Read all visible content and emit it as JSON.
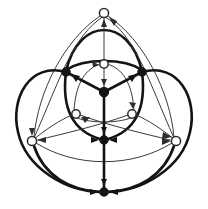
{
  "figure": {
    "width": 208,
    "height": 209,
    "background_color": "#ffffff",
    "symmetry": "3-fold rotational (C3)",
    "colors": {
      "thick_edge": "#141414",
      "thin_edge": "#3a3a3a",
      "filled_node": "#141414",
      "hollow_node_fill": "#ffffff",
      "hollow_node_stroke": "#2b2b2b"
    }
  },
  "legend": {
    "filled_node_label": "filled vertex",
    "hollow_node_label": "hollow vertex",
    "thick_edge_label": "thick directed edge",
    "thin_edge_label": "thin directed edge"
  },
  "nodes": [
    {
      "id": "n-outer-top",
      "name": "outer-top-node",
      "type": "hollow",
      "x": 104,
      "y": 13,
      "r": 4.6
    },
    {
      "id": "n-outer-left",
      "name": "outer-left-node",
      "type": "hollow",
      "x": 32,
      "y": 141,
      "r": 4.6
    },
    {
      "id": "n-outer-right",
      "name": "outer-right-node",
      "type": "hollow",
      "x": 176,
      "y": 141,
      "r": 4.6
    },
    {
      "id": "n-outer-bottom",
      "name": "outer-bottom-node",
      "type": "filled",
      "x": 104,
      "y": 192,
      "r": 4.2
    },
    {
      "id": "n-ring-left",
      "name": "ring-upper-left-node",
      "type": "filled",
      "x": 66,
      "y": 72,
      "r": 4.2
    },
    {
      "id": "n-ring-right",
      "name": "ring-upper-right-node",
      "type": "filled",
      "x": 142,
      "y": 72,
      "r": 4.2
    },
    {
      "id": "n-ring-bottom",
      "name": "ring-bottom-node",
      "type": "filled",
      "x": 104,
      "y": 140,
      "r": 4.2
    },
    {
      "id": "n-inner-top",
      "name": "inner-top-node",
      "type": "hollow",
      "x": 104,
      "y": 64,
      "r": 4.2
    },
    {
      "id": "n-inner-left",
      "name": "inner-lower-left-node",
      "type": "hollow",
      "x": 76,
      "y": 114,
      "r": 4.2
    },
    {
      "id": "n-inner-right",
      "name": "inner-lower-right-node",
      "type": "hollow",
      "x": 132,
      "y": 114,
      "r": 4.2
    },
    {
      "id": "n-hub",
      "name": "center-hub-node",
      "type": "filled",
      "x": 104,
      "y": 92,
      "r": 4.6
    }
  ],
  "edges": [
    {
      "name": "hub-to-ring-left",
      "from": "n-hub",
      "to": "n-ring-left",
      "weight": "thick",
      "directed": true
    },
    {
      "name": "hub-to-ring-right",
      "from": "n-hub",
      "to": "n-ring-right",
      "weight": "thick",
      "directed": true
    },
    {
      "name": "hub-to-ring-bottom",
      "from": "n-hub",
      "to": "n-ring-bottom",
      "weight": "thick",
      "directed": true
    },
    {
      "name": "ring-arc-left-right",
      "from": "n-ring-left",
      "to": "n-ring-right",
      "weight": "thick",
      "directed": false
    },
    {
      "name": "ring-arc-right-bottom",
      "from": "n-ring-right",
      "to": "n-ring-bottom",
      "weight": "thick",
      "directed": false
    },
    {
      "name": "ring-arc-bottom-left",
      "from": "n-ring-bottom",
      "to": "n-ring-left",
      "weight": "thick",
      "directed": false
    },
    {
      "name": "outer-lobe-left",
      "from": "n-ring-left",
      "to": "n-ring-bottom",
      "weight": "thick",
      "directed": false
    },
    {
      "name": "outer-lobe-right",
      "from": "n-ring-right",
      "to": "n-ring-bottom",
      "weight": "thick",
      "directed": false
    },
    {
      "name": "outer-lobe-top",
      "from": "n-ring-left",
      "to": "n-ring-right",
      "weight": "thick",
      "directed": false
    },
    {
      "name": "inner-top-to-hub",
      "from": "n-inner-top",
      "to": "n-hub",
      "weight": "thin",
      "directed": true
    },
    {
      "name": "inner-left-to-hub",
      "from": "n-inner-left",
      "to": "n-hub",
      "weight": "thin",
      "directed": true
    },
    {
      "name": "inner-right-to-hub",
      "from": "n-inner-right",
      "to": "n-hub",
      "weight": "thin",
      "directed": true
    },
    {
      "name": "spoke-outer-top",
      "from": "n-hub",
      "to": "n-outer-top",
      "weight": "thin",
      "directed": true
    },
    {
      "name": "spoke-outer-left",
      "from": "n-hub",
      "to": "n-outer-left",
      "weight": "thin",
      "directed": true
    },
    {
      "name": "spoke-outer-right",
      "from": "n-hub",
      "to": "n-outer-right",
      "weight": "thin",
      "directed": true
    },
    {
      "name": "chord-inner-left",
      "from": "n-inner-right",
      "to": "n-inner-left",
      "weight": "thin",
      "directed": true
    },
    {
      "name": "chord-inner-right",
      "from": "n-inner-left",
      "to": "n-inner-right",
      "weight": "thin",
      "directed": true
    },
    {
      "name": "long-arc-left",
      "from": "n-outer-left",
      "to": "n-outer-top",
      "weight": "thin",
      "directed": true
    },
    {
      "name": "long-arc-right",
      "from": "n-outer-right",
      "to": "n-outer-top",
      "weight": "thin",
      "directed": true
    },
    {
      "name": "long-arc-bottom",
      "from": "n-outer-left",
      "to": "n-outer-right",
      "weight": "thin",
      "directed": true
    },
    {
      "name": "ring-bottom-to-outer-bottom",
      "from": "n-ring-bottom",
      "to": "n-outer-bottom",
      "weight": "thick",
      "directed": true
    },
    {
      "name": "outer-arc-bottom-left",
      "from": "n-outer-left",
      "to": "n-outer-bottom",
      "weight": "thick",
      "directed": true
    },
    {
      "name": "outer-arc-bottom-right",
      "from": "n-outer-right",
      "to": "n-outer-bottom",
      "weight": "thick",
      "directed": true
    }
  ],
  "counts": {
    "total_nodes": 11,
    "filled_nodes": 5,
    "hollow_nodes": 6
  }
}
